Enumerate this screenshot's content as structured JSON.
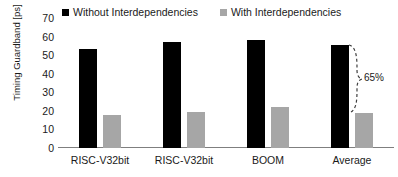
{
  "chart_data": {
    "type": "bar",
    "title": "",
    "subtitle": "",
    "xlabel": "",
    "ylabel": "Timing Guardband [ps]",
    "categories": [
      "RISC-V32bit",
      "RISC-V32bit",
      "BOOM",
      "Average"
    ],
    "series": [
      {
        "name": "Without Interdependencies",
        "color": "#000000",
        "values": [
          53.5,
          57,
          58,
          55.5
        ]
      },
      {
        "name": "With Interdependencies",
        "color": "#A6A6A6",
        "values": [
          18,
          19.5,
          22,
          19
        ]
      }
    ],
    "ylim": [
      0,
      70
    ],
    "yticks": [
      0,
      10,
      20,
      30,
      40,
      50,
      60,
      70
    ],
    "ytick_labels": [
      "0",
      "10",
      "20",
      "30",
      "40",
      "50",
      "60",
      "70"
    ],
    "grid": false,
    "legend_position": "top",
    "annotations": [
      {
        "text": "65%",
        "style": "dashed-curly-brace",
        "group": "Average",
        "from_value": 55.5,
        "to_value": 19
      }
    ]
  },
  "legend": {
    "entries": [
      {
        "label": "Without Interdependencies",
        "swatch": "black-square-icon"
      },
      {
        "label": "With Interdependencies",
        "swatch": "gray-square-icon"
      }
    ]
  }
}
